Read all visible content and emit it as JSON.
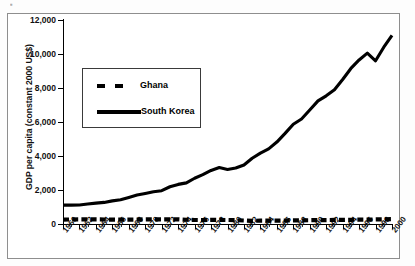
{
  "figure": {
    "artifact_text": "▪",
    "background": "#ffffff",
    "line_color": "#000000"
  },
  "chart_data": {
    "type": "line",
    "title": "",
    "xlabel": "",
    "ylabel": "GDP per capita (constant 2000 US$)",
    "ylim": [
      0,
      12000
    ],
    "xlim": [
      1960,
      2000
    ],
    "ytick_values": [
      0,
      2000,
      4000,
      6000,
      8000,
      10000,
      12000
    ],
    "ytick_labels": [
      "0",
      "2,000",
      "4,000",
      "6,000",
      "8,000",
      "10,000",
      "12,000"
    ],
    "xtick_labels": [
      "1960",
      "1962",
      "1964",
      "1966",
      "1968",
      "1970",
      "1972",
      "1974",
      "1976",
      "1978",
      "1980",
      "1982",
      "1984",
      "1986",
      "1988",
      "1990",
      "1992",
      "1994",
      "1996",
      "1998",
      "2000"
    ],
    "grid": false,
    "legend_position": "upper-left-inside",
    "x": [
      1960,
      1961,
      1962,
      1963,
      1964,
      1965,
      1966,
      1967,
      1968,
      1969,
      1970,
      1971,
      1972,
      1973,
      1974,
      1975,
      1976,
      1977,
      1978,
      1979,
      1980,
      1981,
      1982,
      1983,
      1984,
      1985,
      1986,
      1987,
      1988,
      1989,
      1990,
      1991,
      1992,
      1993,
      1994,
      1995,
      1996,
      1997,
      1998,
      1999,
      2000
    ],
    "series": [
      {
        "name": "South Korea",
        "style": "solid",
        "values": [
          1110,
          1110,
          1120,
          1180,
          1230,
          1270,
          1360,
          1430,
          1560,
          1700,
          1800,
          1900,
          1960,
          2190,
          2330,
          2420,
          2690,
          2900,
          3150,
          3320,
          3210,
          3290,
          3470,
          3870,
          4170,
          4420,
          4820,
          5330,
          5870,
          6180,
          6710,
          7240,
          7540,
          7900,
          8500,
          9150,
          9650,
          10050,
          9600,
          10400,
          11100
        ]
      },
      {
        "name": "Ghana",
        "style": "dashed",
        "values": [
          260,
          265,
          270,
          272,
          268,
          265,
          255,
          252,
          258,
          262,
          272,
          278,
          268,
          272,
          278,
          250,
          235,
          232,
          245,
          238,
          235,
          225,
          205,
          185,
          195,
          198,
          200,
          205,
          212,
          218,
          222,
          228,
          232,
          238,
          242,
          248,
          255,
          262,
          268,
          275,
          282
        ]
      }
    ]
  },
  "legend": {
    "entries": [
      {
        "label": "Ghana",
        "style": "dashed"
      },
      {
        "label": "South Korea",
        "style": "solid"
      }
    ]
  }
}
